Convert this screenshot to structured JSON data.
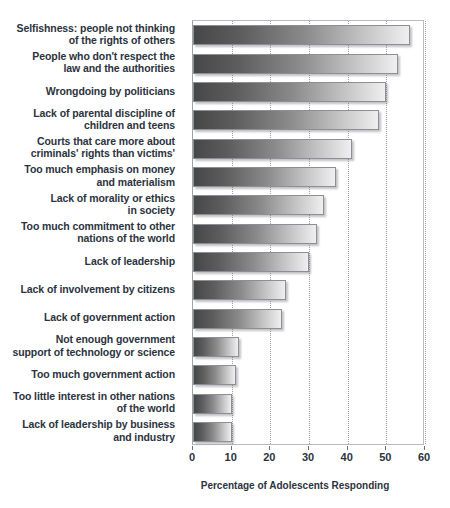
{
  "chart_data": {
    "type": "bar",
    "orientation": "horizontal",
    "title": "",
    "xlabel": "Percentage of Adolescents Responding",
    "ylabel": "",
    "xlim": [
      0,
      60
    ],
    "xticks": [
      0,
      10,
      20,
      30,
      40,
      50,
      60
    ],
    "grid": "vertical-dotted",
    "legend": "none",
    "categories": [
      "Selfishness: people not thinking\nof the rights of others",
      "People who don't respect the\nlaw and the authorities",
      "Wrongdoing by politicians",
      "Lack of parental discipline of\nchildren and teens",
      "Courts that care more about\ncriminals' rights than victims'",
      "Too much emphasis on money\nand materialism",
      "Lack of morality or ethics\nin society",
      "Too much commitment to other\nnations of the world",
      "Lack of leadership",
      "Lack of involvement by citizens",
      "Lack of government action",
      "Not enough government\nsupport of technology or science",
      "Too much government action",
      "Too little interest in other nations\nof the world",
      "Lack of leadership by business\nand industry"
    ],
    "values": [
      56,
      53,
      50,
      48,
      41,
      37,
      34,
      32,
      30,
      24,
      23,
      12,
      11,
      10,
      10
    ],
    "bar_fill_gradient": [
      "#474747",
      "#efefef"
    ],
    "bar_border_color": "#8c9096",
    "text_color": "#2b3340"
  },
  "axis": {
    "tick_labels": [
      "0",
      "10",
      "20",
      "30",
      "40",
      "50",
      "60"
    ],
    "title": "Percentage of Adolescents Responding"
  }
}
